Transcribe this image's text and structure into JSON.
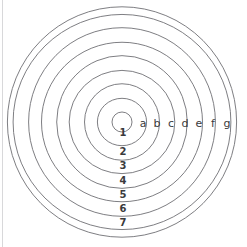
{
  "figure": {
    "background_color": "#ffffff",
    "stroke_color": "#6f6f74",
    "label_color": "#3a3a3c",
    "border_color": "#d8d8da"
  },
  "chart_data": {
    "type": "scatter",
    "title": "",
    "subtitle": "",
    "xlabel": "",
    "ylabel": "",
    "grid": false,
    "legend": "none",
    "center": {
      "x": 122,
      "y": 122
    },
    "radii": [
      10,
      24,
      38,
      52,
      66,
      80,
      94,
      108,
      115
    ],
    "ring_count": 8,
    "letter_labels": [
      "a",
      "b",
      "c",
      "d",
      "e",
      "f",
      "g"
    ],
    "letter_positions_x": [
      143,
      157,
      171,
      185,
      199,
      213,
      227
    ],
    "letter_position_y": 123,
    "number_labels": [
      "1",
      "2",
      "3",
      "4",
      "5",
      "6",
      "7"
    ],
    "number_positions_y": [
      133,
      152,
      166,
      181,
      195,
      209,
      223
    ],
    "number_position_x": 123,
    "xlim": [
      0,
      247
    ],
    "ylim": [
      0,
      247
    ]
  },
  "labels": {
    "letters": [
      {
        "text": "a",
        "x": 143,
        "y": 123
      },
      {
        "text": "b",
        "x": 157,
        "y": 123
      },
      {
        "text": "c",
        "x": 171,
        "y": 123
      },
      {
        "text": "d",
        "x": 185,
        "y": 123
      },
      {
        "text": "e",
        "x": 199,
        "y": 123
      },
      {
        "text": "f",
        "x": 213,
        "y": 123
      },
      {
        "text": "g",
        "x": 227,
        "y": 123
      }
    ],
    "numbers": [
      {
        "text": "1",
        "x": 123,
        "y": 133
      },
      {
        "text": "2",
        "x": 123,
        "y": 152
      },
      {
        "text": "3",
        "x": 123,
        "y": 166
      },
      {
        "text": "4",
        "x": 123,
        "y": 181
      },
      {
        "text": "5",
        "x": 123,
        "y": 195
      },
      {
        "text": "6",
        "x": 123,
        "y": 209
      },
      {
        "text": "7",
        "x": 123,
        "y": 223
      }
    ]
  }
}
